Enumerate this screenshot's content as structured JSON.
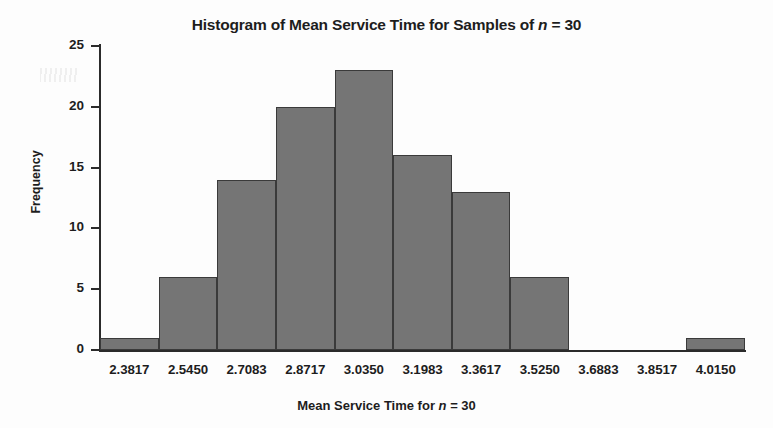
{
  "chart_data": {
    "type": "bar",
    "title": "Histogram of Mean Service Time for Samples of n = 30",
    "title_prefix": "Histogram of Mean Service Time for Samples of ",
    "title_variable": "n",
    "title_suffix": " = 30",
    "xlabel": "Mean Service Time for n = 30",
    "xlabel_prefix": "Mean Service Time for ",
    "xlabel_variable": "n",
    "xlabel_suffix": " = 30",
    "ylabel": "Frequency",
    "categories": [
      "2.3817",
      "2.5450",
      "2.7083",
      "2.8717",
      "3.0350",
      "3.1983",
      "3.3617",
      "3.5250",
      "3.6883",
      "3.8517",
      "4.0150"
    ],
    "values": [
      1,
      6,
      14,
      20,
      23,
      16,
      13,
      6,
      0,
      0,
      1
    ],
    "ylim": [
      0,
      25
    ],
    "yticks": [
      0,
      5,
      10,
      15,
      20,
      25
    ],
    "ytick_labels": [
      "0",
      "5",
      "10",
      "15",
      "20",
      "25"
    ],
    "grid": false,
    "legend": false,
    "bar_fill_color": "#757575",
    "bar_edge_color": "#3a3a3a",
    "axis_color": "#2b2b2b",
    "background_color": "#fdfdfd",
    "total_frequency": 100,
    "bin_width": 0.1633
  }
}
